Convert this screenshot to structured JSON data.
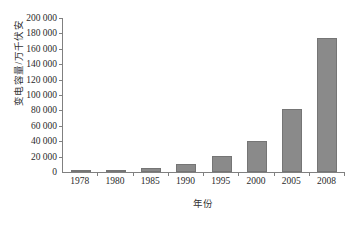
{
  "chart_data": {
    "type": "bar",
    "title": "",
    "xlabel": "年份",
    "ylabel": "变电容量/万千伏安",
    "categories": [
      "1978",
      "1980",
      "1985",
      "1990",
      "1995",
      "2000",
      "2005",
      "2008"
    ],
    "values": [
      1200,
      1700,
      5000,
      11000,
      21000,
      40000,
      82000,
      174000
    ],
    "ylim": [
      0,
      200000
    ],
    "ytick_step": 20000,
    "ytick_labels": [
      "200 000",
      "180 000",
      "160 000",
      "140 000",
      "120 000",
      "100 000",
      "80 000",
      "60 000",
      "40 000",
      "20 000",
      "0"
    ],
    "ytick_values": [
      200000,
      180000,
      160000,
      140000,
      120000,
      100000,
      80000,
      60000,
      40000,
      20000,
      0
    ],
    "grid": false,
    "legend": false,
    "bar_color": "#8a8a8a",
    "bar_edge_color": "#757575",
    "axis_color": "#808080"
  }
}
